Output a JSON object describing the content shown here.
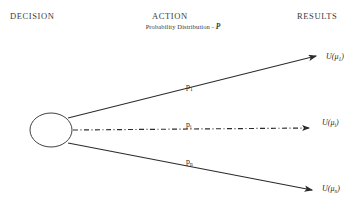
{
  "diagram": {
    "type": "decision-tree",
    "background_color": "#ffffff",
    "line_color": "#2b2b2b",
    "text_color": "#2b2b2b"
  },
  "headers": {
    "decision": "DECISION",
    "action": "ACTION",
    "action_subtitle_text": "Probability Distribution - ",
    "action_subtitle_symbol": "P",
    "results": "RESULTS"
  },
  "decision_node": {
    "shape": "ellipse",
    "label": "",
    "cx": 51,
    "cy": 130,
    "rx": 21,
    "ry": 17
  },
  "branches": [
    {
      "id": "branch-top",
      "probability_label": "p",
      "probability_subscript": "1",
      "line_style": "solid",
      "result_label": "U(μ",
      "result_subscript": "1",
      "result_close": ")"
    },
    {
      "id": "branch-middle",
      "probability_label": "p",
      "probability_subscript": "i",
      "line_style": "dash-dot",
      "result_label": "U(μ",
      "result_subscript": "i",
      "result_close": ")"
    },
    {
      "id": "branch-bottom",
      "probability_label": "p",
      "probability_subscript": "n",
      "line_style": "solid",
      "result_label": "U(μ",
      "result_subscript": "n",
      "result_close": ")"
    }
  ]
}
